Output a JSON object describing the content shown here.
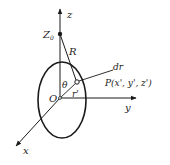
{
  "diagram": {
    "axes": {
      "z": {
        "label": "z"
      },
      "y": {
        "label": "y"
      },
      "x": {
        "label": "x"
      }
    },
    "origin": {
      "label": "O"
    },
    "point_z0": {
      "label": "Z",
      "subscript": "0"
    },
    "distance_R": {
      "label": "R"
    },
    "angle_theta": {
      "label": "θ"
    },
    "radius_r": {
      "label": "r'"
    },
    "element_dr": {
      "label": "dr"
    },
    "point_P": {
      "label": "P(x', y', z')"
    },
    "colors": {
      "stroke": "#1a1a1a",
      "background": "#ffffff"
    }
  }
}
